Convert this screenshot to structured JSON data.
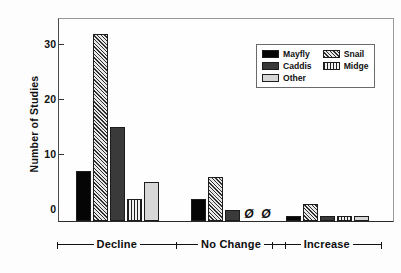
{
  "chart_data": {
    "type": "bar",
    "title": "",
    "subtitle": "",
    "xlabel": "",
    "ylabel": "Number of Studies",
    "categories": [
      "Decline",
      "No Change",
      "Increase"
    ],
    "series": [
      {
        "name": "Mayfly",
        "values": [
          9,
          4,
          1
        ],
        "color": "#050505",
        "pattern": "solid-black"
      },
      {
        "name": "Snail",
        "values": [
          34,
          8,
          3
        ],
        "color": "#2e2e2e",
        "pattern": "diagonal-hatch"
      },
      {
        "name": "Caddis",
        "values": [
          17,
          2,
          1
        ],
        "color": "#3a3a3a",
        "pattern": "solid-dark-gray"
      },
      {
        "name": "Midge",
        "values": [
          4,
          0,
          1
        ],
        "color": "#1e1e1e",
        "pattern": "vertical-lines"
      },
      {
        "name": "Other",
        "values": [
          7,
          0,
          1
        ],
        "color": "#d7d7d7",
        "pattern": "solid-light-gray"
      }
    ],
    "ylim": [
      0,
      37
    ],
    "yticks": [
      0,
      10,
      20,
      30
    ],
    "ytick_labels": [
      "0",
      "10",
      "20",
      "30"
    ],
    "grid": false,
    "legend_position": "upper-right",
    "zero_marker_symbol": "Ø",
    "zero_marker_note": "Bars with value 0 are drawn as a Ø symbol at the baseline",
    "annotations": [
      {
        "text": "Ø",
        "category": "No Change",
        "series": "Midge"
      },
      {
        "text": "Ø",
        "category": "No Change",
        "series": "Other"
      }
    ]
  },
  "legend": {
    "entries": [
      {
        "label": "Mayfly",
        "swatch": "f-mayfly"
      },
      {
        "label": "Snail",
        "swatch": "f-snail"
      },
      {
        "label": "Caddis",
        "swatch": "f-caddis"
      },
      {
        "label": "Midge",
        "swatch": "f-midge"
      },
      {
        "label": "Other",
        "swatch": "f-other"
      }
    ]
  }
}
